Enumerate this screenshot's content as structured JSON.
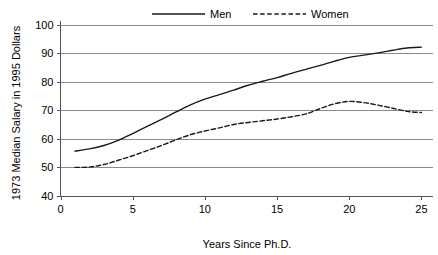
{
  "chart_data": {
    "type": "line",
    "title": "",
    "xlabel": "Years Since Ph.D.",
    "ylabel": "1973 Median Salary in 1995 Dollars",
    "xlim": [
      0,
      25.8
    ],
    "ylim": [
      40,
      100
    ],
    "xticks": [
      0,
      5,
      10,
      15,
      20,
      25
    ],
    "xtick_labels": [
      "0",
      "5",
      "10",
      "15",
      "20",
      "25"
    ],
    "yticks": [
      40,
      50,
      60,
      70,
      80,
      90,
      100
    ],
    "ytick_labels": [
      "40",
      "50",
      "60",
      "70",
      "80",
      "90",
      "100"
    ],
    "grid": "horizontal",
    "legend_position": "top-center",
    "series": [
      {
        "name": "Men",
        "style": "solid",
        "color": "#1a1a1a",
        "x": [
          1,
          2,
          3,
          4,
          5,
          6,
          7,
          8,
          9,
          10,
          11,
          12,
          13,
          14,
          15,
          16,
          17,
          18,
          19,
          20,
          21,
          22,
          23,
          24,
          25
        ],
        "values": [
          55.6,
          56.4,
          57.6,
          59.4,
          61.8,
          64.3,
          66.8,
          69.4,
          71.9,
          73.9,
          75.5,
          77.1,
          78.8,
          80.2,
          81.5,
          83.0,
          84.4,
          85.8,
          87.3,
          88.6,
          89.4,
          90.2,
          91.1,
          91.9,
          92.2
        ]
      },
      {
        "name": "Women",
        "style": "dashed",
        "color": "#1a1a1a",
        "x": [
          1,
          2,
          3,
          4,
          5,
          6,
          7,
          8,
          9,
          10,
          11,
          12,
          13,
          14,
          15,
          16,
          17,
          18,
          19,
          20,
          21,
          22,
          23,
          24,
          25
        ],
        "values": [
          49.9,
          50.0,
          50.9,
          52.4,
          54.0,
          55.8,
          57.6,
          59.6,
          61.4,
          62.7,
          63.8,
          65.0,
          65.7,
          66.3,
          66.9,
          67.7,
          68.7,
          70.6,
          72.3,
          73.1,
          72.7,
          71.8,
          70.7,
          69.6,
          69.2
        ]
      }
    ]
  },
  "legend": {
    "entries": [
      {
        "label": "Men"
      },
      {
        "label": "Women"
      }
    ]
  },
  "axes": {
    "y_title": "1973 Median Salary in 1995 Dollars",
    "x_title": "Years Since Ph.D."
  }
}
